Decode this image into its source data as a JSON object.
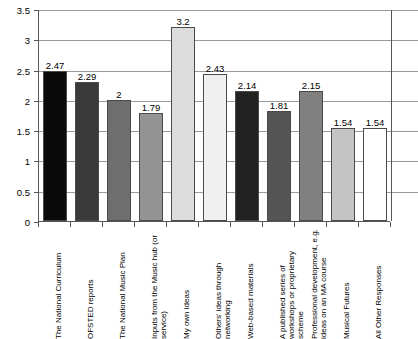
{
  "chart_data": {
    "type": "bar",
    "title": "",
    "subtitle": "",
    "xlabel": "",
    "ylabel": "",
    "ylim": [
      0,
      3.5
    ],
    "yticks": [
      "0",
      "0.5",
      "1",
      "1.5",
      "2",
      "2.5",
      "3",
      "3.5"
    ],
    "ytick_values": [
      0,
      0.5,
      1,
      1.5,
      2,
      2.5,
      3,
      3.5
    ],
    "grid": true,
    "legend": "none",
    "categories": [
      "The National Curriculum",
      "OFSTED reports",
      "The National Music Plan",
      "Inputs from the Music hub (or service)",
      "My own ideas",
      "Others' ideas through networking",
      "Web-based materials",
      "A published series of workshops or proprietary scheme",
      "Professional development, e.g. ideas on an MA course",
      "Musical Futures",
      "All Other Responses"
    ],
    "values": [
      2.47,
      2.29,
      2,
      1.79,
      3.2,
      2.43,
      2.14,
      1.81,
      2.15,
      1.54,
      1.54
    ],
    "value_labels": [
      "2.47",
      "2.29",
      "2",
      "1.79",
      "3.2",
      "2.43",
      "2.14",
      "1.81",
      "2.15",
      "1.54",
      "1.54"
    ],
    "bar_colors": [
      "#0a0a0a",
      "#3a3a3a",
      "#6e6e6e",
      "#949494",
      "#dcdcdc",
      "#f0f0f0",
      "#222222",
      "#555555",
      "#808080",
      "#c4c4c4",
      "#ffffff"
    ],
    "bar_border_color": "#4a4a4a",
    "grid_color": "#9a9a9a",
    "axis_color": "#555555",
    "text_color": "#000000",
    "background": "#ffffff"
  }
}
